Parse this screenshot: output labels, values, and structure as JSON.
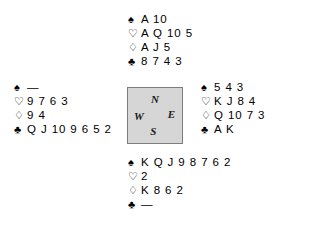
{
  "suits": {
    "spade": {
      "name": "spade-symbol",
      "glyph": "♠",
      "style": "filled"
    },
    "heart": {
      "name": "heart-symbol",
      "glyph": "♡",
      "style": "outline"
    },
    "diamond": {
      "name": "diamond-symbol",
      "glyph": "♢",
      "style": "outline"
    },
    "club": {
      "name": "club-symbol",
      "glyph": "♣",
      "style": "filled"
    }
  },
  "void_marker": "—",
  "compass": {
    "north_label": "N",
    "south_label": "S",
    "west_label": "W",
    "east_label": "E",
    "fill_color": "#d6d6d6",
    "border_color": "#7d7d7d"
  },
  "hands": {
    "north": {
      "position_label": "North",
      "spades": "A 10",
      "hearts": "A Q 10 5",
      "diamonds": "A J 5",
      "clubs": "8 7 4 3"
    },
    "west": {
      "position_label": "West",
      "spades": "—",
      "hearts": "9 7 6 3",
      "diamonds": "9 4",
      "clubs": "Q J 10 9 6 5 2"
    },
    "east": {
      "position_label": "East",
      "spades": "5 4 3",
      "hearts": "K J 8 4",
      "diamonds": "Q 10 7 3",
      "clubs": "A K"
    },
    "south": {
      "position_label": "South",
      "spades": "K Q J 9 8 7 6 2",
      "hearts": "2",
      "diamonds": "K 8 6 2",
      "clubs": "—"
    }
  }
}
